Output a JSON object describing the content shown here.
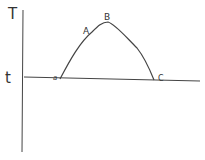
{
  "diagram": {
    "y_axis_label": "T",
    "baseline_label": "t",
    "points": [
      {
        "id": "start",
        "label": "a"
      },
      {
        "id": "rise",
        "label": "A"
      },
      {
        "id": "peak",
        "label": "B"
      },
      {
        "id": "end",
        "label": "C"
      }
    ],
    "colors": {
      "stroke": "#333333",
      "background": "#ffffff"
    }
  }
}
